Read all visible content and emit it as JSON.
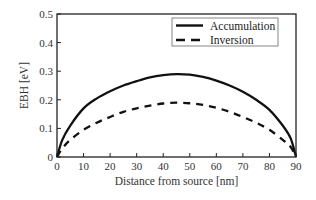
{
  "chart_data": {
    "type": "line",
    "title": "",
    "xlabel": "Distance from source [nm]",
    "ylabel": "EBH [eV]",
    "xlim": [
      0,
      90
    ],
    "ylim": [
      0,
      0.5
    ],
    "xticks": [
      0,
      10,
      20,
      30,
      40,
      50,
      60,
      70,
      80,
      90
    ],
    "xtick_labels": [
      "0",
      "10",
      "20",
      "30",
      "40",
      "50",
      "60",
      "70",
      "80",
      "90"
    ],
    "yticks": [
      0,
      0.1,
      0.2,
      0.3,
      0.4,
      0.5
    ],
    "ytick_labels": [
      "0",
      "0.1",
      "0.2",
      "0.3",
      "0.4",
      "0.5"
    ],
    "grid": false,
    "legend_position": "top-right",
    "series": [
      {
        "name": "Accumulation",
        "style": "solid",
        "color": "#111111",
        "x": [
          0,
          2,
          5,
          10,
          15,
          20,
          25,
          30,
          35,
          40,
          45,
          50,
          55,
          60,
          65,
          70,
          75,
          80,
          85,
          88,
          90
        ],
        "y": [
          0,
          0.06,
          0.11,
          0.17,
          0.205,
          0.23,
          0.25,
          0.265,
          0.278,
          0.286,
          0.29,
          0.288,
          0.28,
          0.267,
          0.25,
          0.228,
          0.2,
          0.165,
          0.11,
          0.065,
          0
        ]
      },
      {
        "name": "Inversion",
        "style": "dashed",
        "color": "#111111",
        "x": [
          0,
          2,
          5,
          10,
          15,
          20,
          25,
          30,
          35,
          40,
          45,
          50,
          55,
          60,
          65,
          70,
          75,
          80,
          85,
          88,
          90
        ],
        "y": [
          0,
          0.03,
          0.06,
          0.095,
          0.12,
          0.14,
          0.158,
          0.17,
          0.18,
          0.187,
          0.19,
          0.188,
          0.182,
          0.172,
          0.158,
          0.14,
          0.12,
          0.095,
          0.06,
          0.035,
          0
        ]
      }
    ]
  }
}
